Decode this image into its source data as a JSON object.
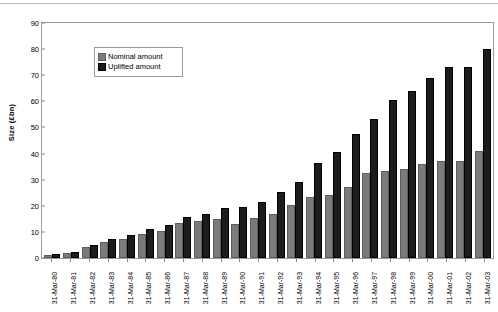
{
  "chart_data": {
    "type": "bar",
    "title": "",
    "xlabel": "",
    "ylabel": "Size (£bn)",
    "ylim": [
      0,
      90
    ],
    "ytick_step": 10,
    "yticks": [
      0,
      10,
      20,
      30,
      40,
      50,
      60,
      70,
      80,
      90
    ],
    "grid": false,
    "legend_position": "top-left",
    "categories": [
      "31-Mar-80",
      "31-Mar-81",
      "31-Mar-82",
      "31-Mar-83",
      "31-Mar-84",
      "31-Mar-85",
      "31-Mar-86",
      "31-Mar-87",
      "31-Mar-88",
      "31-Mar-89",
      "31-Mar-90",
      "31-Mar-91",
      "31-Mar-92",
      "31-Mar-93",
      "31-Mar-94",
      "31-Mar-95",
      "31-Mar-96",
      "31-Mar-97",
      "31-Mar-98",
      "31-Mar-99",
      "31-Mar-00",
      "31-Mar-01",
      "31-Mar-02",
      "31-Mar-03"
    ],
    "series": [
      {
        "name": "Nominal amount",
        "color": "#7b7b7b",
        "values": [
          0.4,
          1.2,
          3.6,
          5.4,
          6.6,
          8.4,
          9.6,
          12.6,
          13.6,
          14.2,
          12.2,
          14.4,
          16.2,
          19.4,
          22.6,
          23.4,
          26.6,
          31.8,
          32.4,
          33.4,
          35.2,
          36.4,
          36.4,
          40.2
        ]
      },
      {
        "name": "Uplifted amount",
        "color": "#1c1c1c",
        "values": [
          0.6,
          1.6,
          4.4,
          6.4,
          8.0,
          10.4,
          11.8,
          15.0,
          16.2,
          18.4,
          18.6,
          20.8,
          24.4,
          28.2,
          35.6,
          40.0,
          46.6,
          52.6,
          59.6,
          63.2,
          68.2,
          72.2,
          72.2,
          79.2
        ]
      }
    ]
  },
  "legend": {
    "items": [
      {
        "label": "Nominal amount"
      },
      {
        "label": "Uplifted amount"
      }
    ]
  }
}
